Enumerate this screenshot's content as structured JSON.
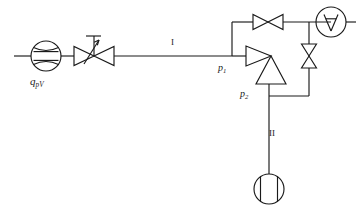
{
  "diagram": {
    "stroke_color": "#1a1a1a",
    "background_color": "#ffffff",
    "labels": {
      "flow_meter": {
        "base": "q",
        "sub": "pV"
      },
      "pressure_1": {
        "base": "p",
        "sub": "1"
      },
      "pressure_2": {
        "base": "p",
        "sub": "2"
      },
      "line_1": "I",
      "line_2": "II"
    },
    "components": [
      {
        "name": "flow-meter",
        "type": "oval-gear-flow-meter",
        "label": "q_pV"
      },
      {
        "name": "control-valve",
        "type": "throttle-control-valve-with-actuator"
      },
      {
        "name": "pipe-line-i",
        "type": "pipe",
        "label": "I"
      },
      {
        "name": "ejector",
        "type": "ejector-two-triangles"
      },
      {
        "name": "shutoff-valve-top",
        "type": "gate-valve-horizontal"
      },
      {
        "name": "shutoff-valve-right",
        "type": "gate-valve-vertical"
      },
      {
        "name": "accumulator",
        "type": "circle-with-inverted-a"
      },
      {
        "name": "pipe-line-ii",
        "type": "pipe",
        "label": "II"
      },
      {
        "name": "pump",
        "type": "circle-with-chords-pump"
      }
    ]
  }
}
